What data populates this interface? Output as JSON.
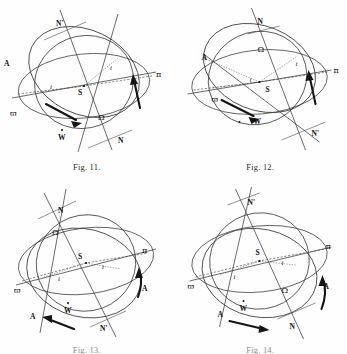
{
  "page": {
    "kind": "scanned-plate",
    "background_color": "#fefefe",
    "ink_color": "#3a3a3a"
  },
  "figures": [
    {
      "id": "fig11",
      "caption": "Fig. 11.",
      "caption_visible": true,
      "labels": {
        "ascending_node": "N",
        "descending_node": "N'",
        "node_symbol": "Ω",
        "perihelion_left": "ϖ",
        "perihelion_right": "π",
        "apex_left": "A",
        "center": "S",
        "antapex": "W",
        "inclination_left": "i",
        "inclination_right": "i"
      },
      "node_top_label": "N'",
      "node_bottom_label": "N"
    },
    {
      "id": "fig12",
      "caption": "Fig. 12.",
      "caption_visible": true,
      "labels": {
        "ascending_node": "N",
        "descending_node": "N'",
        "node_symbol": "Ω",
        "perihelion_left": "ϖ",
        "perihelion_right": "π",
        "apex_left": "A",
        "center": "S",
        "antapex": "W",
        "inclination_left": "i",
        "inclination_right": "i"
      },
      "node_top_label": "N",
      "node_bottom_label": "N'"
    },
    {
      "id": "fig13",
      "caption": "Fig. 13.",
      "caption_visible": false,
      "labels": {
        "ascending_node": "N",
        "descending_node": "N'",
        "node_symbol": "Ω",
        "perihelion_left": "ϖ",
        "perihelion_right": "π",
        "apex_right": "A",
        "apex_left": "A",
        "center": "S",
        "antapex": "W",
        "inclination_left": "i",
        "inclination_right": "i"
      },
      "node_top_label": "N",
      "node_bottom_label": "N'"
    },
    {
      "id": "fig14",
      "caption": "Fig. 14.",
      "caption_visible": false,
      "labels": {
        "ascending_node": "N",
        "descending_node": "N'",
        "node_symbol": "Ω",
        "perihelion_left": "ϖ",
        "perihelion_right": "π",
        "apex_right": "A",
        "apex_left": "A",
        "center": "S",
        "antapex": "W",
        "inclination_left": "i",
        "inclination_right": "i"
      },
      "node_top_label": "N'",
      "node_bottom_label": "N"
    }
  ]
}
